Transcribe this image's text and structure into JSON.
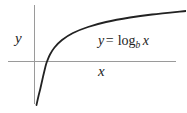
{
  "figure": {
    "name": "logarithm-graph",
    "background_color": "#ffffff",
    "width": 186,
    "height": 113
  },
  "axes": {
    "color": "#9a9a9a",
    "x_axis": {
      "label": "x",
      "y_position": 61,
      "x_start": 8,
      "x_end": 176
    },
    "y_axis": {
      "label": "y",
      "x_position": 34,
      "y_start": 5,
      "y_end": 104
    }
  },
  "equation": {
    "lhs": "y",
    "operator": "=",
    "function": "log",
    "base": "b",
    "argument": "x",
    "full_text": "y = log_b x",
    "color": "#232323"
  },
  "chart_data": {
    "type": "line",
    "title": "",
    "xlabel": "x",
    "ylabel": "y",
    "legend": [
      "y = log_b x"
    ],
    "grid": false,
    "series": [
      {
        "name": "y = log_b x",
        "color": "#222222",
        "line_width": 1.8,
        "x": [
          0.08,
          0.14,
          0.22,
          0.35,
          0.55,
          0.8,
          1.0,
          1.4,
          2.0,
          3.0,
          4.5,
          6.5,
          9.0,
          12.0,
          15.5
        ],
        "y": [
          -2.55,
          -1.98,
          -1.52,
          -1.05,
          -0.6,
          -0.22,
          0.0,
          0.34,
          0.69,
          1.1,
          1.5,
          1.87,
          2.2,
          2.48,
          2.74
        ],
        "pixel_points": [
          [
            36.5,
            105.0
          ],
          [
            38.5,
            96.0
          ],
          [
            40.5,
            88.0
          ],
          [
            42.5,
            79.0
          ],
          [
            44.5,
            70.5
          ],
          [
            46.0,
            64.5
          ],
          [
            47.2,
            61.0
          ],
          [
            50.0,
            54.5
          ],
          [
            54.5,
            47.5
          ],
          [
            62.0,
            40.0
          ],
          [
            73.0,
            33.0
          ],
          [
            88.0,
            27.0
          ],
          [
            106.0,
            22.0
          ],
          [
            130.0,
            17.5
          ],
          [
            152.0,
            14.5
          ],
          [
            186.0,
            11.0
          ]
        ]
      }
    ],
    "xlim": [
      0,
      16
    ],
    "ylim": [
      -2.8,
      3.0
    ],
    "x_axis_crossing": 1.0,
    "asymptote": "x = 0 (vertical)"
  }
}
